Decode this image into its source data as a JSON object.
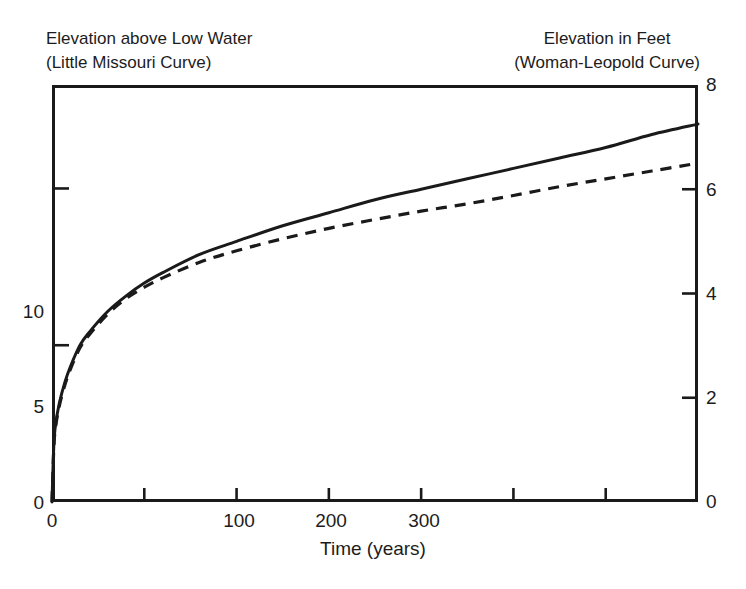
{
  "titles": {
    "left_line1": "Elevation above Low Water",
    "left_line2": "(Little Missouri Curve)",
    "right_line1": "Elevation in Feet",
    "right_line2": "(Woman-Leopold Curve)"
  },
  "axes": {
    "x_title": "Time (years)",
    "x_ticks": [
      "0",
      "100",
      "200",
      "300"
    ],
    "y_left_ticks": [
      "0",
      "5",
      "10"
    ],
    "y_right_ticks": [
      "0",
      "2",
      "4",
      "6",
      "8"
    ]
  },
  "colors": {
    "axis": "#1a1a1a",
    "curve_solid": "#1a1a1a",
    "curve_dashed": "#1a1a1a",
    "background": "#ffffff"
  },
  "chart_data": {
    "type": "line",
    "title": "",
    "xlabel": "Time (years)",
    "ylabel": "Elevation above Low Water",
    "ylabel_right": "Elevation in Feet",
    "xlim": [
      0,
      350
    ],
    "ylim_left": [
      0,
      13.3
    ],
    "ylim_right": [
      0,
      8
    ],
    "grid": false,
    "legend": "none",
    "x_major_ticks": [
      0,
      100,
      200,
      300
    ],
    "x_minor_ticks": [
      50,
      150,
      250
    ],
    "y_left_major_ticks": [
      0,
      5,
      10
    ],
    "y_right_major_ticks": [
      0,
      2,
      4,
      6,
      8
    ],
    "series": [
      {
        "name": "Little Missouri Curve",
        "style": "solid",
        "note": "solid line, values read on right axis in feet",
        "x": [
          0,
          1,
          2,
          4,
          7,
          10,
          15,
          20,
          30,
          40,
          50,
          60,
          80,
          100,
          125,
          150,
          175,
          200,
          225,
          250,
          275,
          300,
          325,
          350
        ],
        "y_feet": [
          0.0,
          1.1,
          1.5,
          1.9,
          2.3,
          2.6,
          3.0,
          3.25,
          3.65,
          3.95,
          4.2,
          4.4,
          4.75,
          5.0,
          5.3,
          5.55,
          5.8,
          6.0,
          6.2,
          6.4,
          6.6,
          6.8,
          7.05,
          7.25
        ]
      },
      {
        "name": "Woman-Leopold Curve",
        "style": "dashed",
        "note": "dashed line, values read on right axis in feet",
        "x": [
          0,
          1,
          2,
          4,
          7,
          10,
          15,
          20,
          30,
          40,
          50,
          60,
          80,
          100,
          125,
          150,
          175,
          200,
          225,
          250,
          275,
          300,
          325,
          350
        ],
        "y_feet": [
          0.0,
          1.05,
          1.45,
          1.85,
          2.25,
          2.55,
          2.95,
          3.2,
          3.6,
          3.9,
          4.12,
          4.3,
          4.6,
          4.82,
          5.05,
          5.25,
          5.42,
          5.58,
          5.72,
          5.88,
          6.05,
          6.2,
          6.35,
          6.5
        ]
      }
    ]
  }
}
